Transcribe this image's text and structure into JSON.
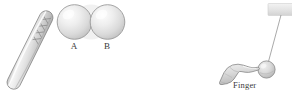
{
  "figure": {
    "background_color": "#ffffff",
    "stroke_color": "#6e6e6e",
    "title": "",
    "objects": {
      "charged_rod": {
        "name": "rubbed rod",
        "description": "long cylindrical rod tilted diagonally with cross-hatch X markings near upper end",
        "fill_light": "#f2f2f2",
        "fill_mid": "#d8d8d8",
        "fill_dark": "#bdbdbd",
        "outline": "#7d7d7d",
        "hatch_marks": "XXXX"
      },
      "sphere_a": {
        "label": "A",
        "fill_light": "#fbfbfb",
        "fill_mid": "#dfdfdf",
        "fill_dark": "#c3c3c3",
        "outline": "#909090"
      },
      "sphere_b": {
        "label": "B",
        "fill_light": "#fbfbfb",
        "fill_mid": "#dfdfdf",
        "fill_dark": "#c3c3c3",
        "outline": "#909090"
      },
      "hand": {
        "label": "Finger",
        "description": "hand with extended index finger pointing right toward hanging ball",
        "fill_light": "#ededed",
        "fill_mid": "#d2d2d2",
        "fill_dark": "#b4b4b4",
        "outline": "#808080"
      },
      "support_block": {
        "description": "light gray rectangular support/ceiling block at top right",
        "fill_light": "#efefef",
        "fill_mid": "#dcdcdc",
        "outline": "#c8c8c8"
      },
      "thread": {
        "description": "thin thread suspending ball from support",
        "color": "#9a9a9a"
      },
      "hanging_ball": {
        "description": "small sphere hanging from thread",
        "fill_light": "#e8e8e8",
        "fill_mid": "#cfcfcf",
        "fill_dark": "#b0b0b0",
        "outline": "#868686"
      }
    },
    "labels": {
      "sphere_a": "A",
      "sphere_b": "B",
      "finger": "Finger"
    }
  }
}
